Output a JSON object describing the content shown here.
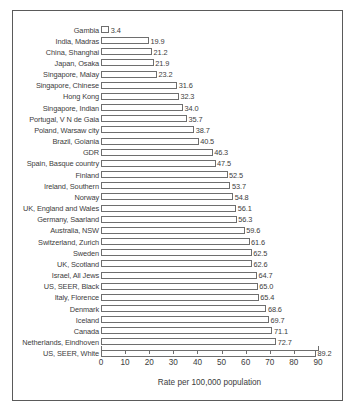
{
  "chart_data": {
    "type": "bar",
    "orientation": "horizontal",
    "title": "",
    "xlabel": "Rate per 100,000 population",
    "ylabel": "",
    "xlim": [
      0,
      90
    ],
    "xticks": [
      0,
      10,
      20,
      30,
      40,
      50,
      60,
      70,
      80,
      90
    ],
    "grid": false,
    "legend": null,
    "categories": [
      "Gambia",
      "India, Madras",
      "China, Shanghai",
      "Japan, Osaka",
      "Singapore, Malay",
      "Singapore, Chinese",
      "Hong Kong",
      "Singapore, Indian",
      "Portugal, V N de Gaia",
      "Poland, Warsaw city",
      "Brazil, Goiania",
      "GDR",
      "Spain, Basque country",
      "Finland",
      "Ireland, Southern",
      "Norway",
      "UK, England and Wales",
      "Germany, Saarland",
      "Australia, NSW",
      "Switzerland, Zurich",
      "Sweden",
      "UK, Scotland",
      "Israel, All Jews",
      "US, SEER, Black",
      "Italy, Florence",
      "Denmark",
      "Iceland",
      "Canada",
      "Netherlands, Eindhoven",
      "US, SEER, White"
    ],
    "values": [
      3.4,
      19.9,
      21.2,
      21.9,
      23.2,
      31.6,
      32.3,
      34.0,
      35.7,
      38.7,
      40.5,
      46.3,
      47.5,
      52.5,
      53.7,
      54.8,
      56.1,
      56.3,
      59.6,
      61.6,
      62.5,
      62.6,
      64.7,
      65.0,
      65.4,
      68.6,
      69.7,
      71.1,
      72.7,
      89.2
    ],
    "value_labels": [
      "3.4",
      "19.9",
      "21.2",
      "21.9",
      "23.2",
      "31.6",
      "32.3",
      "34.0",
      "35.7",
      "38.7",
      "40.5",
      "46.3",
      "47.5",
      "52.5",
      "53.7",
      "54.8",
      "56.1",
      "56.3",
      "59.6",
      "61.6",
      "62.5",
      "62.6",
      "64.7",
      "65.0",
      "65.4",
      "68.6",
      "69.7",
      "71.1",
      "72.7",
      "89.2"
    ],
    "tick_labels": [
      "0",
      "10",
      "20",
      "30",
      "40",
      "50",
      "60",
      "70",
      "80",
      "90"
    ],
    "colors": {
      "bar_fill": "#ffffff",
      "bar_stroke": "#6e6e6e",
      "text": "#3c3c3c",
      "frame": "#5a5a5a",
      "background": "#ffffff"
    }
  }
}
